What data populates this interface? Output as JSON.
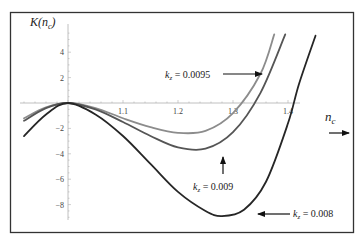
{
  "chart_data": {
    "type": "line",
    "title": "",
    "xlabel": "n_c",
    "ylabel": "K(n_c)",
    "xlim": [
      0.92,
      1.47
    ],
    "ylim": [
      -9,
      5.5
    ],
    "x_ticks": [
      1.1,
      1.2,
      1.3,
      1.4
    ],
    "x_tick_labels": [
      "1.1",
      "1.2",
      "1.3",
      "1.4"
    ],
    "y_ticks": [
      4,
      2,
      -2,
      -4,
      -6,
      -8
    ],
    "y_tick_labels": [
      "4",
      "2",
      "−2",
      "−4",
      "−6",
      "−8"
    ],
    "grid": false,
    "legend": "none (inline annotations with arrows)",
    "series": [
      {
        "name": "k_z = 0.0095",
        "color": "#8c8c8c",
        "points": [
          [
            0.92,
            -1.2
          ],
          [
            0.96,
            -0.35
          ],
          [
            1.0,
            0
          ],
          [
            1.05,
            -0.4
          ],
          [
            1.1,
            -1.2
          ],
          [
            1.15,
            -1.9
          ],
          [
            1.2,
            -2.35
          ],
          [
            1.25,
            -2.2
          ],
          [
            1.3,
            -0.8
          ],
          [
            1.35,
            2.3
          ],
          [
            1.375,
            5.4
          ]
        ]
      },
      {
        "name": "k_z = 0.009",
        "color": "#555555",
        "points": [
          [
            0.92,
            -1.4
          ],
          [
            0.96,
            -0.4
          ],
          [
            1.0,
            0
          ],
          [
            1.05,
            -0.5
          ],
          [
            1.1,
            -1.5
          ],
          [
            1.15,
            -2.6
          ],
          [
            1.2,
            -3.5
          ],
          [
            1.25,
            -3.6
          ],
          [
            1.3,
            -2.3
          ],
          [
            1.35,
            0.8
          ],
          [
            1.395,
            5.4
          ]
        ]
      },
      {
        "name": "k_z = 0.008",
        "color": "#262626",
        "points": [
          [
            0.92,
            -2.6
          ],
          [
            0.96,
            -0.9
          ],
          [
            1.0,
            0
          ],
          [
            1.05,
            -0.9
          ],
          [
            1.1,
            -2.6
          ],
          [
            1.15,
            -4.8
          ],
          [
            1.2,
            -7.0
          ],
          [
            1.25,
            -8.5
          ],
          [
            1.28,
            -8.9
          ],
          [
            1.32,
            -8.4
          ],
          [
            1.36,
            -6.2
          ],
          [
            1.4,
            -1.6
          ],
          [
            1.42,
            1.5
          ],
          [
            1.45,
            5.3
          ]
        ]
      }
    ],
    "annotations": [
      {
        "text": "k_z = 0.0095",
        "arrow": "right",
        "target_series": 0
      },
      {
        "text": "k_z = 0.009",
        "arrow": "up",
        "target_series": 1
      },
      {
        "text": "k_z = 0.008",
        "arrow": "left",
        "target_series": 2
      },
      {
        "text": "n_c",
        "arrow": "right",
        "role": "x-axis label"
      }
    ]
  },
  "labels": {
    "y_axis": {
      "main": "K(n",
      "sub": "c",
      "close": ")"
    },
    "x_axis": {
      "main": "n",
      "sub": "c"
    },
    "ann_0095": {
      "k": "k",
      "sub": "z",
      "value": " = 0.0095"
    },
    "ann_009": {
      "k": "k",
      "sub": "z",
      "value": " = 0.009"
    },
    "ann_008": {
      "k": "k",
      "sub": "z",
      "value": " = 0.008"
    }
  }
}
